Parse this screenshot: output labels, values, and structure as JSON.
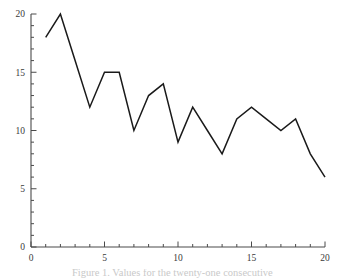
{
  "figure": {
    "background_color": "#ffffff",
    "caption_clipped": "Figure 1. Values for the twenty-one consecutive"
  },
  "chart_data": {
    "type": "line",
    "title": "",
    "subtitle": "",
    "xlabel": "",
    "ylabel": "",
    "xlim": [
      0,
      20
    ],
    "ylim": [
      0,
      20
    ],
    "grid": false,
    "legend": false,
    "markers": false,
    "line_color": "#1a1a1a",
    "line_width": 1.5,
    "axis_color": "#4a4a4a",
    "spines": [
      "left",
      "bottom"
    ],
    "x_major_ticks": [
      0,
      5,
      10,
      15,
      20
    ],
    "x_minor_ticks": [
      1,
      2,
      3,
      4,
      6,
      7,
      8,
      9,
      11,
      12,
      13,
      14,
      16,
      17,
      18,
      19
    ],
    "x_tick_labels": [
      "0",
      "5",
      "10",
      "15",
      "20"
    ],
    "y_major_ticks": [
      0,
      5,
      10,
      15,
      20
    ],
    "y_minor_ticks": [
      1,
      2,
      3,
      4,
      6,
      7,
      8,
      9,
      11,
      12,
      13,
      14,
      16,
      17,
      18,
      19
    ],
    "y_tick_labels": [
      "0",
      "5",
      "10",
      "15",
      "20"
    ],
    "series": [
      {
        "name": "series-1",
        "x": [
          1,
          2,
          3,
          4,
          5,
          6,
          7,
          8,
          9,
          10,
          11,
          12,
          13,
          14,
          15,
          16,
          17,
          18,
          19,
          20
        ],
        "values": [
          18,
          20,
          16,
          12,
          15,
          15,
          10,
          13,
          14,
          9,
          12,
          10,
          8,
          11,
          12,
          11,
          10,
          11,
          8,
          6
        ]
      }
    ]
  }
}
